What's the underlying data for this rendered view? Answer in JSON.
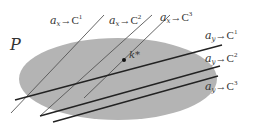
{
  "diagram": {
    "region_label": "P",
    "point_label": "k*",
    "colors": {
      "region_fill": "#b4b4b4",
      "line_x": "#555555",
      "line_y": "#222222",
      "text": "#333333"
    },
    "x_lines": [
      {
        "var": "a",
        "sub": "x",
        "target": "C",
        "sup": "1"
      },
      {
        "var": "a",
        "sub": "x",
        "target": "C",
        "sup": "2"
      },
      {
        "var": "a",
        "sub": "x",
        "target": "C",
        "sup": "3"
      }
    ],
    "y_lines": [
      {
        "var": "a",
        "sub": "y",
        "target": "C",
        "sup": "1"
      },
      {
        "var": "a",
        "sub": "y",
        "target": "C",
        "sup": "2"
      },
      {
        "var": "a",
        "sub": "y",
        "target": "C",
        "sup": "3"
      }
    ],
    "arrow": "→"
  }
}
